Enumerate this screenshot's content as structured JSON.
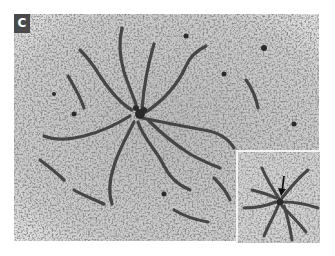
{
  "figure": {
    "panel_label": "C",
    "colors": {
      "background": "#cfcfcf",
      "strand": "#3a3a3a",
      "label_bg": "#4a4a4a",
      "label_text": "#ffffff"
    },
    "inset": {
      "has_arrow": true,
      "arrow_direction": "down"
    }
  }
}
